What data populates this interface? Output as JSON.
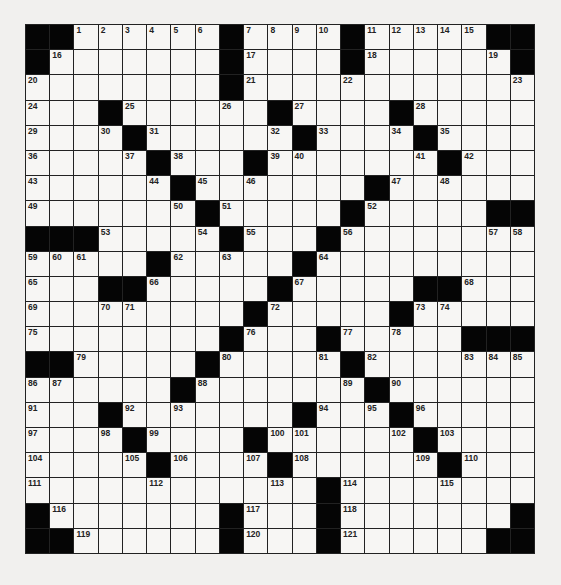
{
  "puzzle": {
    "rows": 21,
    "cols": 21,
    "colors": {
      "black": "#050505",
      "white": "#f7f6f4",
      "line": "#222222",
      "background": "#f1f0ee"
    },
    "grid": [
      "##.......#....#.....##",
      "#........#....#......#",
      ".........#...........",
      "...#....#.#....#.....",
      "....#.....#....#.....",
      ".....#...#......#....",
      "......#.......#......",
      ".......#.....#.....##",
      "###....#...#.........",
      ".....#.....#.........",
      "...##.....#.....##...",
      ".........#.....#.....",
      "........#...#.....###",
      "##.....#....#........",
      "......#......#.......",
      "...#.......#..#......",
      "....#....#.....#.....",
      ".....#...#......#....",
      "............#........",
      "#.......#...#......#",
      "##......#...#......##"
    ],
    "numbers": [
      {
        "r": 0,
        "c": 2,
        "n": "1"
      },
      {
        "r": 0,
        "c": 3,
        "n": "2"
      },
      {
        "r": 0,
        "c": 4,
        "n": "3"
      },
      {
        "r": 0,
        "c": 5,
        "n": "4"
      },
      {
        "r": 0,
        "c": 6,
        "n": "5"
      },
      {
        "r": 0,
        "c": 7,
        "n": "6"
      },
      {
        "r": 0,
        "c": 9,
        "n": "7"
      },
      {
        "r": 0,
        "c": 10,
        "n": "8"
      },
      {
        "r": 0,
        "c": 11,
        "n": "9"
      },
      {
        "r": 0,
        "c": 12,
        "n": "10"
      },
      {
        "r": 0,
        "c": 14,
        "n": "11"
      },
      {
        "r": 0,
        "c": 15,
        "n": "12"
      },
      {
        "r": 0,
        "c": 16,
        "n": "13"
      },
      {
        "r": 0,
        "c": 17,
        "n": "14"
      },
      {
        "r": 0,
        "c": 18,
        "n": "15"
      },
      {
        "r": 1,
        "c": 1,
        "n": "16"
      },
      {
        "r": 1,
        "c": 9,
        "n": "17"
      },
      {
        "r": 1,
        "c": 14,
        "n": "18"
      },
      {
        "r": 1,
        "c": 19,
        "n": "19"
      },
      {
        "r": 2,
        "c": 0,
        "n": "20"
      },
      {
        "r": 2,
        "c": 9,
        "n": "21"
      },
      {
        "r": 2,
        "c": 13,
        "n": "22"
      },
      {
        "r": 2,
        "c": 20,
        "n": "23"
      },
      {
        "r": 3,
        "c": 0,
        "n": "24"
      },
      {
        "r": 3,
        "c": 4,
        "n": "25"
      },
      {
        "r": 3,
        "c": 8,
        "n": "26"
      },
      {
        "r": 3,
        "c": 11,
        "n": "27"
      },
      {
        "r": 3,
        "c": 16,
        "n": "28"
      },
      {
        "r": 4,
        "c": 0,
        "n": "29"
      },
      {
        "r": 4,
        "c": 3,
        "n": "30"
      },
      {
        "r": 4,
        "c": 5,
        "n": "31"
      },
      {
        "r": 4,
        "c": 10,
        "n": "32"
      },
      {
        "r": 4,
        "c": 12,
        "n": "33"
      },
      {
        "r": 4,
        "c": 15,
        "n": "34"
      },
      {
        "r": 4,
        "c": 17,
        "n": "35"
      },
      {
        "r": 5,
        "c": 0,
        "n": "36"
      },
      {
        "r": 5,
        "c": 4,
        "n": "37"
      },
      {
        "r": 5,
        "c": 6,
        "n": "38"
      },
      {
        "r": 5,
        "c": 10,
        "n": "39"
      },
      {
        "r": 5,
        "c": 11,
        "n": "40"
      },
      {
        "r": 5,
        "c": 16,
        "n": "41"
      },
      {
        "r": 5,
        "c": 18,
        "n": "42"
      },
      {
        "r": 6,
        "c": 0,
        "n": "43"
      },
      {
        "r": 6,
        "c": 5,
        "n": "44"
      },
      {
        "r": 6,
        "c": 7,
        "n": "45"
      },
      {
        "r": 6,
        "c": 9,
        "n": "46"
      },
      {
        "r": 6,
        "c": 15,
        "n": "47"
      },
      {
        "r": 6,
        "c": 17,
        "n": "48"
      },
      {
        "r": 7,
        "c": 0,
        "n": "49"
      },
      {
        "r": 7,
        "c": 6,
        "n": "50"
      },
      {
        "r": 7,
        "c": 8,
        "n": "51"
      },
      {
        "r": 7,
        "c": 14,
        "n": "52"
      },
      {
        "r": 8,
        "c": 3,
        "n": "53"
      },
      {
        "r": 8,
        "c": 7,
        "n": "54"
      },
      {
        "r": 8,
        "c": 9,
        "n": "55"
      },
      {
        "r": 8,
        "c": 13,
        "n": "56"
      },
      {
        "r": 8,
        "c": 19,
        "n": "57"
      },
      {
        "r": 8,
        "c": 20,
        "n": "58"
      },
      {
        "r": 9,
        "c": 0,
        "n": "59"
      },
      {
        "r": 9,
        "c": 1,
        "n": "60"
      },
      {
        "r": 9,
        "c": 2,
        "n": "61"
      },
      {
        "r": 9,
        "c": 6,
        "n": "62"
      },
      {
        "r": 9,
        "c": 8,
        "n": "63"
      },
      {
        "r": 9,
        "c": 12,
        "n": "64"
      },
      {
        "r": 10,
        "c": 0,
        "n": "65"
      },
      {
        "r": 10,
        "c": 5,
        "n": "66"
      },
      {
        "r": 10,
        "c": 11,
        "n": "67"
      },
      {
        "r": 10,
        "c": 18,
        "n": "68"
      },
      {
        "r": 11,
        "c": 0,
        "n": "69"
      },
      {
        "r": 11,
        "c": 3,
        "n": "70"
      },
      {
        "r": 11,
        "c": 4,
        "n": "71"
      },
      {
        "r": 11,
        "c": 10,
        "n": "72"
      },
      {
        "r": 11,
        "c": 16,
        "n": "73"
      },
      {
        "r": 11,
        "c": 17,
        "n": "74"
      },
      {
        "r": 12,
        "c": 0,
        "n": "75"
      },
      {
        "r": 12,
        "c": 9,
        "n": "76"
      },
      {
        "r": 12,
        "c": 13,
        "n": "77"
      },
      {
        "r": 12,
        "c": 15,
        "n": "78"
      },
      {
        "r": 13,
        "c": 2,
        "n": "79"
      },
      {
        "r": 13,
        "c": 8,
        "n": "80"
      },
      {
        "r": 13,
        "c": 12,
        "n": "81"
      },
      {
        "r": 13,
        "c": 14,
        "n": "82"
      },
      {
        "r": 13,
        "c": 18,
        "n": "83"
      },
      {
        "r": 13,
        "c": 19,
        "n": "84"
      },
      {
        "r": 13,
        "c": 20,
        "n": "85"
      },
      {
        "r": 14,
        "c": 0,
        "n": "86"
      },
      {
        "r": 14,
        "c": 1,
        "n": "87"
      },
      {
        "r": 14,
        "c": 7,
        "n": "88"
      },
      {
        "r": 14,
        "c": 13,
        "n": "89"
      },
      {
        "r": 14,
        "c": 15,
        "n": "90"
      },
      {
        "r": 15,
        "c": 0,
        "n": "91"
      },
      {
        "r": 15,
        "c": 4,
        "n": "92"
      },
      {
        "r": 15,
        "c": 6,
        "n": "93"
      },
      {
        "r": 15,
        "c": 12,
        "n": "94"
      },
      {
        "r": 15,
        "c": 14,
        "n": "95"
      },
      {
        "r": 15,
        "c": 16,
        "n": "96"
      },
      {
        "r": 16,
        "c": 0,
        "n": "97"
      },
      {
        "r": 16,
        "c": 3,
        "n": "98"
      },
      {
        "r": 16,
        "c": 5,
        "n": "99"
      },
      {
        "r": 16,
        "c": 10,
        "n": "100"
      },
      {
        "r": 16,
        "c": 11,
        "n": "101"
      },
      {
        "r": 16,
        "c": 15,
        "n": "102"
      },
      {
        "r": 16,
        "c": 17,
        "n": "103"
      },
      {
        "r": 17,
        "c": 0,
        "n": "104"
      },
      {
        "r": 17,
        "c": 4,
        "n": "105"
      },
      {
        "r": 17,
        "c": 6,
        "n": "106"
      },
      {
        "r": 17,
        "c": 9,
        "n": "107"
      },
      {
        "r": 17,
        "c": 11,
        "n": "108"
      },
      {
        "r": 17,
        "c": 16,
        "n": "109"
      },
      {
        "r": 17,
        "c": 18,
        "n": "110"
      },
      {
        "r": 18,
        "c": 0,
        "n": "111"
      },
      {
        "r": 18,
        "c": 5,
        "n": "112"
      },
      {
        "r": 18,
        "c": 10,
        "n": "113"
      },
      {
        "r": 18,
        "c": 13,
        "n": "114"
      },
      {
        "r": 18,
        "c": 17,
        "n": "115"
      },
      {
        "r": 19,
        "c": 1,
        "n": "116"
      },
      {
        "r": 19,
        "c": 9,
        "n": "117"
      },
      {
        "r": 19,
        "c": 13,
        "n": "118"
      },
      {
        "r": 20,
        "c": 2,
        "n": "119"
      },
      {
        "r": 20,
        "c": 9,
        "n": "120"
      },
      {
        "r": 20,
        "c": 13,
        "n": "121"
      }
    ]
  }
}
